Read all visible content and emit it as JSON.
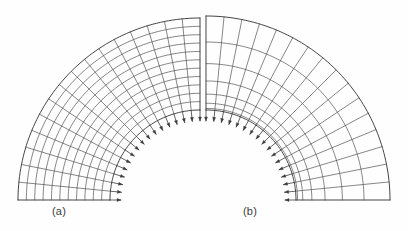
{
  "figure": {
    "background_color": "#fefefe",
    "line_color": "#3c3c3c",
    "arrow_color": "#3c3c3c",
    "label_color": "#3a3a3a",
    "width": 408,
    "height": 231
  },
  "panels": [
    {
      "id": "panel-a",
      "label": "(a)",
      "label_x": 52,
      "label_y": 205,
      "mesh_type": "uniform",
      "description": "quarter annulus mesh, uniform grading",
      "center_x": 200,
      "center_y": 200,
      "inner_radius": 90,
      "outer_radius": 182,
      "start_angle_deg": 90,
      "end_angle_deg": 180,
      "radial_divisions": 11,
      "circumferential_divisions": 16,
      "load_arrows": {
        "count": 16,
        "on_edge": "inner-arc",
        "direction": "outward-radial",
        "length": 11,
        "head_length": 4,
        "head_width": 3
      }
    },
    {
      "id": "panel-b",
      "label": "(b)",
      "label_x": 243,
      "label_y": 205,
      "mesh_type": "graded",
      "description": "quarter annulus mesh, refined toward the inner arc",
      "center_x": 206,
      "center_y": 200,
      "inner_radius": 90,
      "outer_radius": 184,
      "start_angle_deg": 0,
      "end_angle_deg": 90,
      "radial_divisions": 7,
      "circumferential_divisions": 16,
      "radial_grading_exponent": 2.1,
      "circumferential_grading": "uniform",
      "load_arrows": {
        "count": 16,
        "on_edge": "inner-arc",
        "direction": "outward-radial",
        "length": 11,
        "head_length": 4,
        "head_width": 3
      }
    }
  ],
  "chart_data": {
    "type": "diagram",
    "panels": [
      "(a)",
      "(b)"
    ],
    "geometry": "quarter annulus",
    "inner_radius": 90,
    "outer_radius": 182,
    "sweep_degrees": 90,
    "mesh_a_elements": "11 radial x 16 circumferential, uniform",
    "mesh_b_elements": "7 radial x 16 circumferential, graded toward inner arc",
    "boundary_condition": "radial traction arrows distributed along the inner arc of each panel",
    "support": "fixed base at the horizontal bottom edge"
  }
}
